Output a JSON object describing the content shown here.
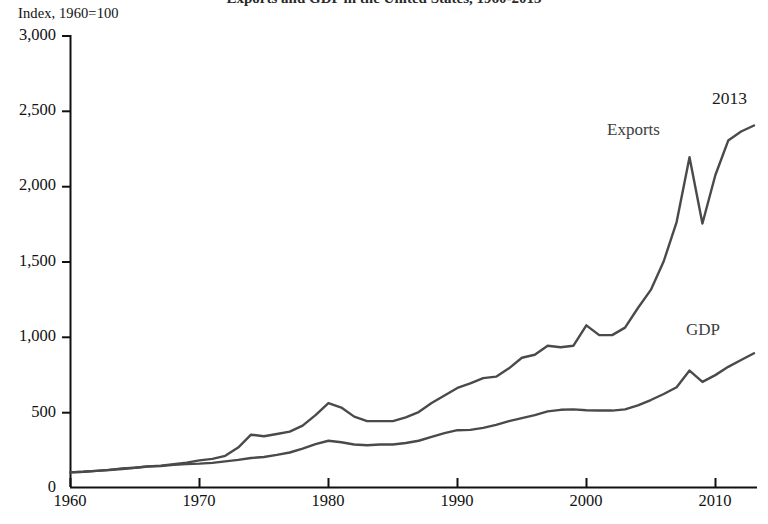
{
  "figure": {
    "title_cropped": "Exports and GDP in the United States, 1960-2013",
    "unit_label": "Index, 1960=100",
    "annotation_year": "2013",
    "line_color": "#4a4a4a",
    "axis_color": "#111111",
    "background": "#ffffff"
  },
  "chart_data": {
    "type": "line",
    "title": "Exports and GDP in the United States, 1960-2013",
    "xlabel": "",
    "ylabel": "Index, 1960=100",
    "xlim": [
      1960,
      2013
    ],
    "ylim": [
      0,
      3000
    ],
    "grid": false,
    "legend": "inline-labels",
    "xticks": [
      "1960",
      "1970",
      "1980",
      "1990",
      "2000",
      "2010"
    ],
    "xtick_values": [
      1960,
      1970,
      1980,
      1990,
      2000,
      2010
    ],
    "yticks": [
      "0",
      "500",
      "1,000",
      "1,500",
      "2,000",
      "2,500",
      "3,000"
    ],
    "ytick_values": [
      0,
      500,
      1000,
      1500,
      2000,
      2500,
      3000
    ],
    "annotations": [
      {
        "text": "2013",
        "x": 2012,
        "y": 2660
      },
      {
        "text": "Exports",
        "x": 2003,
        "y": 2330
      },
      {
        "text": "GDP",
        "x": 2009,
        "y": 1050
      }
    ],
    "x": [
      1960,
      1961,
      1962,
      1963,
      1964,
      1965,
      1966,
      1967,
      1968,
      1969,
      1970,
      1971,
      1972,
      1973,
      1974,
      1975,
      1976,
      1977,
      1978,
      1979,
      1980,
      1981,
      1982,
      1983,
      1984,
      1985,
      1986,
      1987,
      1988,
      1989,
      1990,
      1991,
      1992,
      1993,
      1994,
      1995,
      1996,
      1997,
      1998,
      1999,
      2000,
      2001,
      2002,
      2003,
      2004,
      2005,
      2006,
      2007,
      2008,
      2009,
      2010,
      2011,
      2012,
      2013
    ],
    "series": [
      {
        "name": "Exports",
        "values": [
          100,
          104,
          110,
          117,
          127,
          131,
          140,
          145,
          155,
          165,
          180,
          190,
          210,
          265,
          350,
          340,
          355,
          370,
          410,
          480,
          560,
          530,
          470,
          440,
          440,
          440,
          465,
          500,
          560,
          610,
          660,
          690,
          725,
          735,
          790,
          860,
          880,
          940,
          930,
          940,
          1075,
          1010,
          1010,
          1060,
          1190,
          1310,
          1500,
          1760,
          2190,
          1750,
          2070,
          2300,
          2360,
          2400
        ]
      },
      {
        "name": "GDP",
        "values": [
          100,
          104,
          110,
          116,
          123,
          131,
          139,
          142,
          150,
          155,
          158,
          163,
          173,
          183,
          196,
          202,
          216,
          232,
          258,
          288,
          310,
          300,
          285,
          280,
          285,
          285,
          295,
          310,
          335,
          360,
          380,
          382,
          395,
          415,
          440,
          460,
          480,
          505,
          515,
          518,
          512,
          510,
          510,
          518,
          545,
          580,
          620,
          665,
          775,
          700,
          745,
          800,
          845,
          890
        ]
      }
    ]
  }
}
